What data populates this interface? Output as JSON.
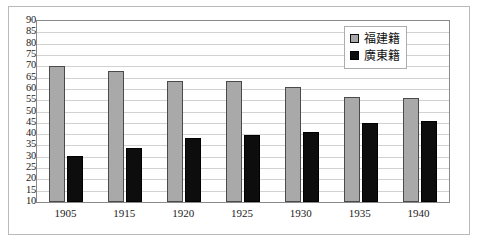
{
  "chart_data": {
    "type": "bar",
    "title": "",
    "subtitle": "",
    "xlabel": "",
    "ylabel": "",
    "categories": [
      "1905",
      "1915",
      "1920",
      "1925",
      "1930",
      "1935",
      "1940"
    ],
    "series": [
      {
        "name": "福建籍",
        "color": "#a9a9a9",
        "values": [
          70,
          68,
          63.5,
          63.5,
          61,
          56.5,
          56
        ]
      },
      {
        "name": "廣東籍",
        "color": "#0d0d0d",
        "values": [
          30.5,
          34,
          38.5,
          39.5,
          41,
          45,
          46
        ]
      }
    ],
    "ylim": [
      10,
      90
    ],
    "ytick_step": 5,
    "yticks": [
      90,
      85,
      80,
      75,
      70,
      65,
      60,
      55,
      50,
      45,
      40,
      35,
      30,
      25,
      20,
      15,
      10
    ],
    "ytick_labels": [
      "90",
      "85",
      "80",
      "75",
      "70",
      "65",
      "60",
      "55",
      "50",
      "45",
      "40",
      "35",
      "30",
      "25",
      "20",
      "15",
      "10"
    ],
    "grid": true,
    "grid_axis": "y",
    "legend_position": "top-right",
    "legend_entries": [
      "福建籍",
      "廣東籍"
    ],
    "plot_background": "#ffffff",
    "grid_color": "#d2d2d2",
    "axis_color": "#8a8a8a"
  }
}
